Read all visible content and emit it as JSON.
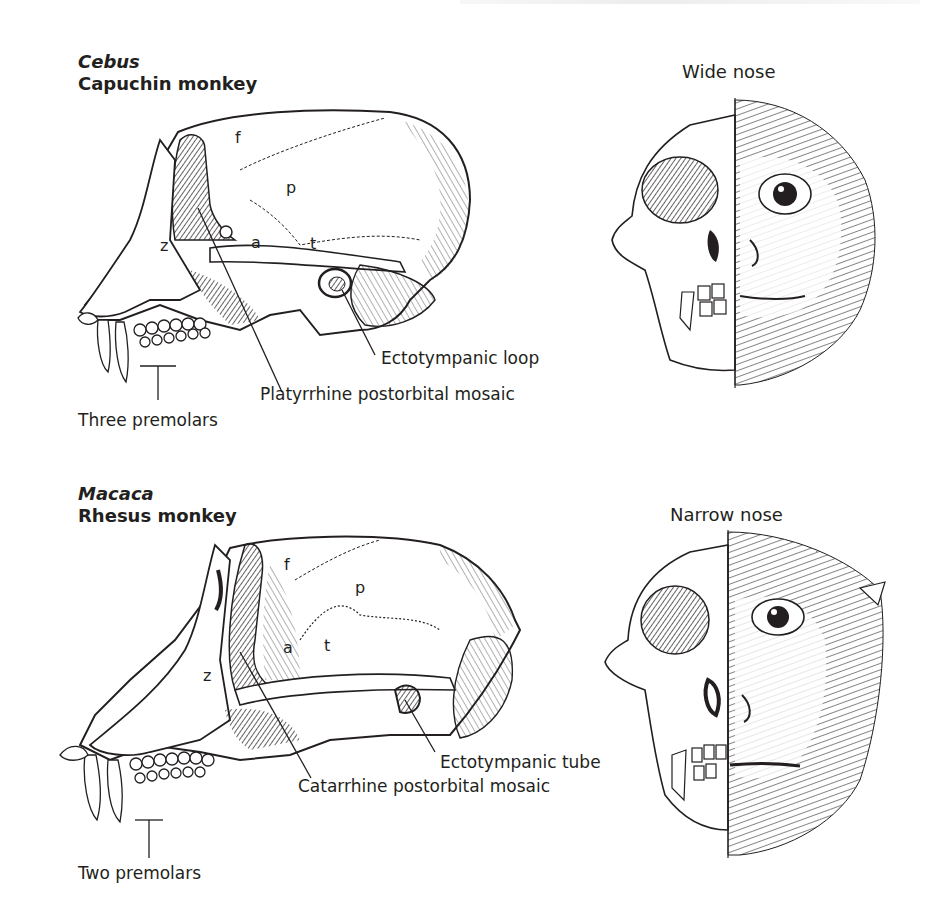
{
  "figure": {
    "panels": [
      {
        "id": "cebus",
        "genus": "Cebus",
        "common_name": "Capuchin monkey",
        "nose_label": "Wide nose",
        "bone_labels": {
          "frontal": "f",
          "parietal": "p",
          "alisphenoid": "a",
          "temporal": "t",
          "zygomatic": "z"
        },
        "callouts": {
          "ear": "Ectotympanic loop",
          "postorbital": "Platyrrhine postorbital mosaic",
          "premolars": "Three premolars"
        }
      },
      {
        "id": "macaca",
        "genus": "Macaca",
        "common_name": "Rhesus monkey",
        "nose_label": "Narrow nose",
        "bone_labels": {
          "frontal": "f",
          "parietal": "p",
          "alisphenoid": "a",
          "temporal": "t",
          "zygomatic": "z"
        },
        "callouts": {
          "ear": "Ectotympanic tube",
          "postorbital": "Catarrhine postorbital mosaic",
          "premolars": "Two premolars"
        }
      }
    ],
    "colors": {
      "ink": "#231f20",
      "background": "#ffffff",
      "shade": "#3a3a3a"
    }
  }
}
